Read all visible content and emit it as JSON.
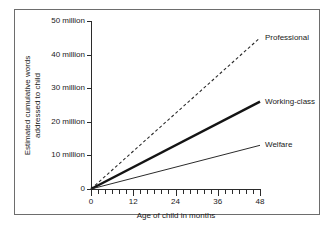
{
  "chart_data": {
    "type": "line",
    "title": "",
    "xlabel": "Age of child in months",
    "ylabel": "Estimated cumulative words addressed to child",
    "ylabel_line1": "Estimated cumulative words",
    "ylabel_line2": "addressed to child",
    "xlim": [
      0,
      48
    ],
    "ylim": [
      0,
      50
    ],
    "grid": false,
    "legend_position": "inline-right",
    "x_ticks_major": [
      0,
      12,
      24,
      36,
      48
    ],
    "x_tick_labels": [
      "0",
      "12",
      "24",
      "36",
      "48"
    ],
    "x_minor_step": 2,
    "y_ticks": [
      0,
      10,
      20,
      30,
      40,
      50
    ],
    "y_tick_labels": [
      "0",
      "10 million",
      "20 million",
      "30 million",
      "40 million",
      "50 million"
    ],
    "y_unit": "million",
    "x": [
      0,
      48
    ],
    "series": [
      {
        "name": "Professional",
        "label": "Professional",
        "values": [
          0,
          45
        ],
        "style": "dashed",
        "width": 1.1,
        "color": "#2b2b2b",
        "label_x": 48,
        "label_y": 45
      },
      {
        "name": "Working-class",
        "label": "Working-class",
        "values": [
          0,
          26
        ],
        "style": "solid",
        "width": 2.4,
        "color": "#141414",
        "label_x": 48,
        "label_y": 26
      },
      {
        "name": "Welfare",
        "label": "Welfare",
        "values": [
          0,
          13
        ],
        "style": "solid",
        "width": 1.0,
        "color": "#2b2b2b",
        "label_x": 48,
        "label_y": 13
      }
    ]
  },
  "axes": {
    "x_title": "Age of child in months",
    "y_title_line1": "Estimated cumulative words",
    "y_title_line2": "addressed to child",
    "y_labels": [
      "50 million",
      "40 million",
      "30 million",
      "20 million",
      "10 million",
      "0"
    ],
    "x_labels": [
      "0",
      "12",
      "24",
      "36",
      "48"
    ]
  },
  "series_labels": {
    "professional": "Professional",
    "working_class": "Working-class",
    "welfare": "Welfare"
  },
  "colors": {
    "axis": "#2b2b2b",
    "frame": "#6d6d6d",
    "text": "#1a1a1a",
    "background": "#ffffff",
    "professional_line": "#2b2b2b",
    "working_class_line": "#141414",
    "welfare_line": "#2b2b2b"
  }
}
